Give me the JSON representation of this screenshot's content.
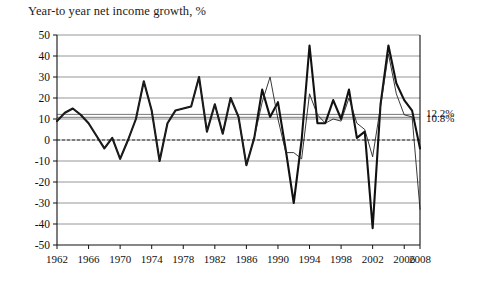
{
  "chart_data": {
    "type": "line",
    "title": "Year-to year net income growth, %",
    "xlabel": "",
    "ylabel": "",
    "xlim": [
      1962,
      2008
    ],
    "ylim": [
      -50,
      50
    ],
    "ytick_step": 10,
    "grid": true,
    "legend": "none",
    "zero_line": true,
    "yticks": [
      "50",
      "40",
      "30",
      "20",
      "10",
      "0",
      "-10",
      "-20",
      "-30",
      "-40",
      "-50"
    ],
    "ytick_values": [
      50,
      40,
      30,
      20,
      10,
      0,
      -10,
      -20,
      -30,
      -40,
      -50
    ],
    "xticks": [
      "1962",
      "1966",
      "1970",
      "1974",
      "1978",
      "1982",
      "1986",
      "1990",
      "1994",
      "1998",
      "2002",
      "2006",
      "2008"
    ],
    "xtick_values": [
      1962,
      1966,
      1970,
      1974,
      1978,
      1982,
      1986,
      1990,
      1994,
      1998,
      2002,
      2006,
      2008
    ],
    "x": [
      1962,
      1963,
      1964,
      1965,
      1966,
      1967,
      1968,
      1969,
      1970,
      1971,
      1972,
      1973,
      1974,
      1975,
      1976,
      1977,
      1978,
      1979,
      1980,
      1981,
      1982,
      1983,
      1984,
      1985,
      1986,
      1987,
      1988,
      1989,
      1990,
      1991,
      1992,
      1993,
      1994,
      1995,
      1996,
      1997,
      1998,
      1999,
      2000,
      2001,
      2002,
      2003,
      2004,
      2005,
      2006,
      2007,
      2008
    ],
    "series": [
      {
        "name": "net-income-growth-thick",
        "style": "thick",
        "color": "#111111",
        "width": 2.1,
        "values": [
          9,
          13,
          15,
          12,
          8,
          2,
          -4,
          1,
          -9,
          0,
          10,
          28,
          14,
          -10,
          8,
          14,
          15,
          16,
          30,
          4,
          17,
          3,
          20,
          11,
          -12,
          1,
          24,
          11,
          18,
          -5,
          -30,
          0,
          45,
          8,
          8,
          19,
          10,
          24,
          1,
          4,
          -42,
          17,
          45,
          27,
          19,
          14,
          -4
        ]
      },
      {
        "name": "net-income-growth-thin",
        "style": "thin",
        "color": "#222222",
        "width": 0.9,
        "values": [
          9,
          13,
          15,
          12,
          8,
          2,
          -4,
          1,
          -9,
          0,
          10,
          28,
          14,
          -10,
          8,
          14,
          15,
          16,
          30,
          4,
          17,
          3,
          20,
          11,
          -12,
          1,
          18,
          30,
          10,
          -6,
          -6,
          -9,
          22,
          12,
          8,
          10,
          9,
          20,
          8,
          5,
          -8,
          16,
          41,
          22,
          12,
          11,
          -33
        ]
      }
    ],
    "reference_lines": [
      {
        "name": "ref-line-upper",
        "value": 12.2,
        "label": "12.2%"
      },
      {
        "name": "ref-line-lower",
        "value": 10.8,
        "label": "10.8%"
      }
    ]
  }
}
